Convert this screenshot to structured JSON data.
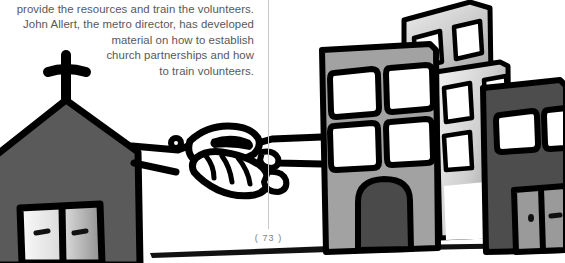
{
  "page": {
    "number_label": "( 73 )",
    "width": 565,
    "height": 263,
    "background": "#ffffff"
  },
  "body_text": {
    "color": "#58585a",
    "alignment": "right",
    "lines": [
      "provide the resources and train the volunteers.",
      "John Allert, the metro director, has developed",
      "material on how to establish",
      "church partnerships and how",
      "to train volunteers."
    ]
  },
  "gutter": {
    "color": "#c8c8c8"
  },
  "illustration": {
    "title": "church-and-city-handshake",
    "description": "Hand-drawn cartoon of a church building on the left shaking hands with a row of city apartment buildings on the right.",
    "ink_color": "#000000",
    "parts": {
      "church": {
        "name": "church-building",
        "fill": "#5a5a5a",
        "cross": "cross-on-steeple",
        "doors_gradient_from": "#f2f2f2",
        "doors_gradient_to": "#8c8c8c"
      },
      "handshake": {
        "name": "handshake",
        "stroke": "#000000",
        "fill": "#ffffff"
      },
      "building_front": {
        "name": "mid-gray-apartment-building",
        "fill": "#a2a2a2",
        "windows": 4,
        "window_fill": "#ffffff",
        "door_fill": "#4a4a4a"
      },
      "building_back": {
        "name": "background-apartment-building",
        "gradient_from": "#e4e4e4",
        "gradient_to": "#8e8e8e",
        "windows": 4
      },
      "building_right": {
        "name": "dark-gray-apartment-building",
        "fill": "#4d4d4d",
        "windows": 2,
        "window_fill": "#ffffff",
        "door_fill": "#9a9a9a"
      },
      "ground": {
        "name": "ground-shadow-line",
        "fill": "#000000"
      }
    }
  }
}
